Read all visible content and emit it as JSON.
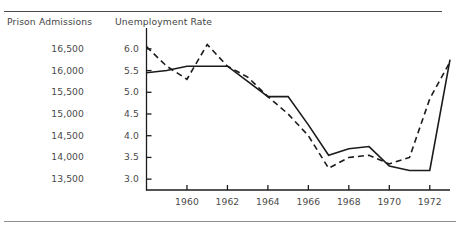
{
  "figure": {
    "left_axis_title": "Prison Admissions",
    "right_axis_title": "Unemployment Rate"
  },
  "chart_data": {
    "type": "line",
    "title": "",
    "subtitle": "",
    "xlabel": "",
    "ylabel": "Unemployment Rate",
    "y2label": "Prison Admissions",
    "grid": false,
    "legend": "none",
    "x": [
      1958,
      1959,
      1960,
      1961,
      1962,
      1963,
      1964,
      1965,
      1966,
      1967,
      1968,
      1969,
      1970,
      1971,
      1972,
      1973
    ],
    "xlim": [
      1958,
      1973
    ],
    "xticks": [
      1960,
      1962,
      1964,
      1966,
      1968,
      1970,
      1972
    ],
    "xtick_labels": [
      "1960",
      "1962",
      "1964",
      "1966",
      "1968",
      "1970",
      "1972"
    ],
    "ylim": [
      2.75,
      6.25
    ],
    "yticks": [
      3.0,
      3.5,
      4.0,
      4.5,
      5.0,
      5.5,
      6.0
    ],
    "ytick_labels": [
      "3.0",
      "3.5",
      "4.0",
      "4.5",
      "5.0",
      "5.5",
      "6.0"
    ],
    "y2ticks": [
      13500,
      14000,
      14500,
      15000,
      15500,
      16000,
      16500
    ],
    "y2tick_labels": [
      "13,500",
      "14,000",
      "14,500",
      "15,000",
      "15,500",
      "16,000",
      "16,500"
    ],
    "series": [
      {
        "name": "Prison Admissions",
        "style": "solid",
        "color": "#1b1b1b",
        "axis": "left",
        "values": [
          5.45,
          5.5,
          5.6,
          5.6,
          5.6,
          5.25,
          4.9,
          4.9,
          4.25,
          3.55,
          3.7,
          3.75,
          3.3,
          3.2,
          3.2,
          5.75
        ]
      },
      {
        "name": "Unemployment Rate",
        "style": "dashed",
        "color": "#1b1b1b",
        "axis": "right",
        "values": [
          6.05,
          5.6,
          5.3,
          6.1,
          5.6,
          5.35,
          4.9,
          4.5,
          4.0,
          3.25,
          3.5,
          3.55,
          3.35,
          3.5,
          4.85,
          5.7
        ]
      }
    ]
  }
}
